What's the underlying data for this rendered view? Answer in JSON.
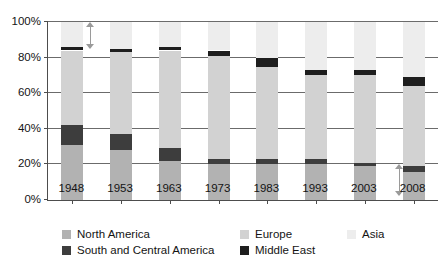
{
  "chart_data": {
    "type": "bar",
    "title": "",
    "subtitle": "",
    "xlabel": "",
    "ylabel": "",
    "stacked": true,
    "grid": true,
    "legend_position": "bottom",
    "ylim": [
      0,
      100
    ],
    "y_ticks": [
      "0%",
      "20%",
      "40%",
      "60%",
      "80%",
      "100%"
    ],
    "y_tick_values": [
      0,
      20,
      40,
      60,
      80,
      100
    ],
    "categories": [
      "1948",
      "1953",
      "1963",
      "1973",
      "1983",
      "1993",
      "2003",
      "2008"
    ],
    "series": [
      {
        "name": "North America",
        "color": "#b2b2b2",
        "values": [
          31,
          28,
          22,
          20,
          20,
          20,
          19,
          16
        ]
      },
      {
        "name": "South and Central America",
        "color": "#3d3d3d",
        "values": [
          11,
          9,
          7,
          3,
          3,
          3,
          2,
          3
        ]
      },
      {
        "name": "Europe",
        "color": "#d2d2d2",
        "values": [
          42,
          46,
          55,
          58,
          52,
          47,
          49,
          45
        ]
      },
      {
        "name": "Middle East",
        "color": "#1e1e1e",
        "values": [
          2,
          2,
          2,
          3,
          5,
          3,
          3,
          5
        ]
      },
      {
        "name": "Asia",
        "color": "#ededed",
        "values": [
          14,
          15,
          14,
          16,
          20,
          27,
          27,
          31
        ]
      }
    ],
    "annotations": [
      {
        "name": "asia-share-arrow-1948",
        "kind": "double-headed-vertical-arrow",
        "category": "1948",
        "from_value": 85,
        "to_value": 100
      },
      {
        "name": "north-america-share-arrow-2008",
        "kind": "double-headed-vertical-arrow",
        "category": "2008",
        "from_value": 2,
        "to_value": 20
      }
    ]
  },
  "legend": {
    "entries": [
      {
        "label": "North America",
        "color": "#b2b2b2"
      },
      {
        "label": "Europe",
        "color": "#d2d2d2"
      },
      {
        "label": "Asia",
        "color": "#ededed"
      },
      {
        "label": "South and Central America",
        "color": "#3d3d3d"
      },
      {
        "label": "Middle East",
        "color": "#1e1e1e"
      }
    ]
  }
}
